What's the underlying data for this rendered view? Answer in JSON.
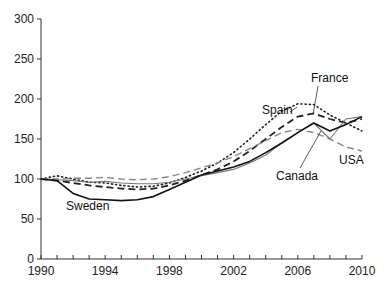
{
  "chart_data": {
    "type": "line",
    "title": "",
    "xlabel": "",
    "ylabel": "",
    "xlim": [
      1990,
      2010
    ],
    "ylim": [
      0,
      300
    ],
    "grid": false,
    "legend_position": "inline annotations",
    "x_ticks": [
      "1990",
      "1994",
      "1998",
      "2002",
      "2006",
      "2010"
    ],
    "y_ticks": [
      "0",
      "50",
      "100",
      "150",
      "200",
      "250",
      "300"
    ],
    "x": [
      1990,
      1991,
      1992,
      1993,
      1994,
      1995,
      1996,
      1997,
      1998,
      1999,
      2000,
      2001,
      2002,
      2003,
      2004,
      2005,
      2006,
      2007,
      2008,
      2009,
      2010
    ],
    "series": [
      {
        "name": "Spain",
        "style": "dotted",
        "color": "#222222",
        "values": [
          100,
          104,
          100,
          96,
          95,
          92,
          90,
          91,
          95,
          102,
          110,
          120,
          133,
          150,
          168,
          185,
          194,
          193,
          180,
          170,
          160
        ]
      },
      {
        "name": "France",
        "style": "dashed-heavy",
        "color": "#222222",
        "values": [
          100,
          98,
          95,
          92,
          90,
          88,
          87,
          88,
          92,
          98,
          105,
          112,
          122,
          135,
          150,
          165,
          178,
          182,
          175,
          170,
          175
        ]
      },
      {
        "name": "USA",
        "style": "dashed-light",
        "color": "#888888",
        "values": [
          100,
          100,
          101,
          101,
          102,
          100,
          99,
          100,
          103,
          108,
          114,
          120,
          128,
          138,
          148,
          158,
          162,
          158,
          150,
          140,
          135
        ]
      },
      {
        "name": "Canada",
        "style": "solid-thin",
        "color": "#777777",
        "values": [
          100,
          99,
          98,
          96,
          97,
          95,
          94,
          94,
          96,
          100,
          104,
          108,
          112,
          120,
          130,
          145,
          158,
          170,
          150,
          175,
          178
        ]
      },
      {
        "name": "Sweden",
        "style": "solid",
        "color": "#111111",
        "values": [
          100,
          98,
          82,
          75,
          74,
          73,
          74,
          78,
          87,
          96,
          105,
          110,
          115,
          122,
          133,
          145,
          158,
          170,
          160,
          168,
          178
        ]
      }
    ],
    "annotations": [
      {
        "label": "Spain",
        "x": 2005.6,
        "y": 193
      },
      {
        "label": "France",
        "x": 2007,
        "y": 183
      },
      {
        "label": "USA",
        "x": 2009,
        "y": 137
      },
      {
        "label": "Canada",
        "x": 2007,
        "y": 170
      },
      {
        "label": "Sweden",
        "x": 1993,
        "y": 74
      }
    ]
  }
}
